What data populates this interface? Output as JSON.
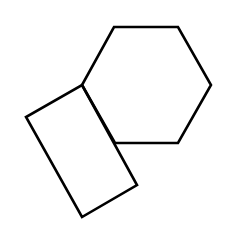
{
  "diagram": {
    "stroke_color": "#000000",
    "fill_color": "#ffffff",
    "stroke_width": 2.6,
    "shapes": [
      {
        "name": "hexagon",
        "type": "polygon",
        "points": [
          [
            114,
            27
          ],
          [
            178,
            27
          ],
          [
            211,
            85
          ],
          [
            178,
            143
          ],
          [
            115,
            143
          ],
          [
            82,
            85
          ]
        ]
      },
      {
        "name": "rectangle",
        "type": "polygon",
        "points": [
          [
            82,
            85
          ],
          [
            137,
            185
          ],
          [
            82,
            217
          ],
          [
            26,
            117
          ]
        ]
      }
    ]
  }
}
